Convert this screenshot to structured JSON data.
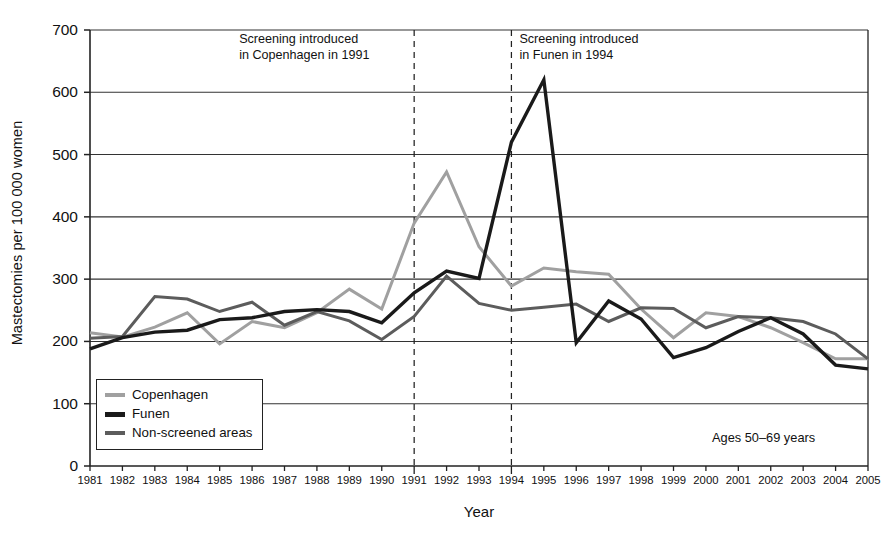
{
  "chart_data": {
    "type": "line",
    "title": "",
    "xlabel": "Year",
    "ylabel": "Mastectomies per 100 000 women",
    "ylim": [
      0,
      700
    ],
    "ytick_step": 100,
    "yticks": [
      0,
      100,
      200,
      300,
      400,
      500,
      600,
      700
    ],
    "grid": "horizontal",
    "legend_position": "bottom-left",
    "x": [
      1981,
      1982,
      1983,
      1984,
      1985,
      1986,
      1987,
      1988,
      1989,
      1990,
      1991,
      1992,
      1993,
      1994,
      1995,
      1996,
      1997,
      1998,
      1999,
      2000,
      2001,
      2002,
      2003,
      2004,
      2005
    ],
    "categories": [
      "1981",
      "1982",
      "1983",
      "1984",
      "1985",
      "1986",
      "1987",
      "1988",
      "1989",
      "1990",
      "1991",
      "1992",
      "1993",
      "1994",
      "1995",
      "1996",
      "1997",
      "1998",
      "1999",
      "2000",
      "2001",
      "2002",
      "2003",
      "2004",
      "2005"
    ],
    "series": [
      {
        "name": "Copenhagen",
        "color": "#a0a0a0",
        "values": [
          214,
          207,
          223,
          246,
          196,
          232,
          222,
          246,
          284,
          252,
          390,
          472,
          352,
          289,
          318,
          312,
          308,
          252,
          206,
          246,
          240,
          222,
          198,
          172,
          172
        ]
      },
      {
        "name": "Funen",
        "color": "#1a1a1a",
        "values": [
          188,
          206,
          215,
          218,
          235,
          238,
          248,
          251,
          248,
          230,
          278,
          313,
          301,
          520,
          620,
          198,
          265,
          236,
          174,
          190,
          216,
          238,
          212,
          162,
          156
        ]
      },
      {
        "name": "Non-screened areas",
        "color": "#5c5c5c",
        "values": [
          205,
          208,
          272,
          268,
          248,
          263,
          226,
          248,
          233,
          203,
          240,
          305,
          261,
          250,
          255,
          260,
          232,
          254,
          253,
          222,
          240,
          238,
          232,
          212,
          172
        ]
      }
    ],
    "annotations": [
      {
        "text": "Screening introduced\nin Copenhagen in 1991",
        "at_year": 1991
      },
      {
        "text": "Screening introduced\nin Funen in 1994",
        "at_year": 1994
      },
      {
        "text": "Ages 50–69 years"
      }
    ],
    "vlines": [
      1991,
      1994
    ]
  },
  "legend": {
    "items": [
      {
        "label": "Copenhagen"
      },
      {
        "label": "Funen"
      },
      {
        "label": "Non-screened areas"
      }
    ]
  },
  "notes": {
    "copenhagen": "Screening introduced\nin Copenhagen in 1991",
    "funen": "Screening introduced\nin Funen in 1994",
    "ages": "Ages 50–69 years"
  },
  "axes": {
    "x_title": "Year",
    "y_title": "Mastectomies per 100 000 women"
  }
}
